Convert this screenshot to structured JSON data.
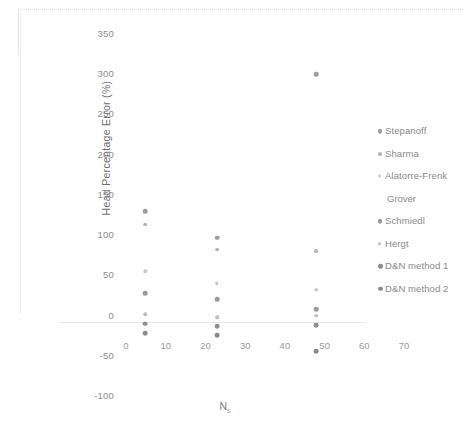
{
  "chart_data": {
    "type": "scatter",
    "title": "",
    "xlabel": "N",
    "xlabel_sub": "s",
    "ylabel": "Head Percentage Error (%)",
    "xlim": [
      0,
      74
    ],
    "ylim": [
      -100,
      365
    ],
    "xticks": [
      "0",
      "10",
      "20",
      "30",
      "40",
      "50",
      "60",
      "70"
    ],
    "xtick_values": [
      0,
      10,
      20,
      30,
      40,
      50,
      60,
      70
    ],
    "yticks": [
      "350",
      "300",
      "250",
      "200",
      "150",
      "100",
      "50",
      "0",
      "-50",
      "-100"
    ],
    "ytick_values": [
      350,
      300,
      250,
      200,
      150,
      100,
      50,
      0,
      -50,
      -100
    ],
    "grid": false,
    "legend_position": "right",
    "series": [
      {
        "name": "Stepanoff",
        "color": "#9c9c9c",
        "size": 2.4,
        "points": [
          {
            "x": 20,
            "y": 130
          },
          {
            "x": 38,
            "y": 97
          },
          {
            "x": 63,
            "y": 300
          }
        ]
      },
      {
        "name": "Sharma",
        "color": "#b4b4b4",
        "size": 2.0,
        "points": [
          {
            "x": 20,
            "y": 113
          },
          {
            "x": 38,
            "y": 82
          },
          {
            "x": 63,
            "y": 80
          }
        ]
      },
      {
        "name": "Alatorre-Frenk",
        "name_cont": "Grover",
        "color": "#c9c9c9",
        "size": 1.8,
        "points": [
          {
            "x": 20,
            "y": 55
          },
          {
            "x": 38,
            "y": 40
          },
          {
            "x": 63,
            "y": 32
          }
        ]
      },
      {
        "name": "Schmiedl",
        "color": "#9a9a9a",
        "size": 2.4,
        "points": [
          {
            "x": 20,
            "y": 28
          },
          {
            "x": 38,
            "y": 20
          },
          {
            "x": 63,
            "y": 8
          }
        ]
      },
      {
        "name": "Hergt",
        "color": "#bdbdbd",
        "size": 1.9,
        "points": [
          {
            "x": 20,
            "y": 2
          },
          {
            "x": 38,
            "y": -2
          },
          {
            "x": 63,
            "y": 0
          }
        ]
      },
      {
        "name": "D&N method 1",
        "color": "#8f8f8f",
        "size": 2.5,
        "points": [
          {
            "x": 20,
            "y": -10
          },
          {
            "x": 38,
            "y": -13
          },
          {
            "x": 63,
            "y": -12
          }
        ]
      },
      {
        "name": "D&N method 2",
        "color": "#8a8a8a",
        "size": 2.5,
        "points": [
          {
            "x": 20,
            "y": -22
          },
          {
            "x": 38,
            "y": -24
          },
          {
            "x": 63,
            "y": -44
          }
        ]
      }
    ]
  },
  "legend": {
    "items": [
      {
        "label": "Stepanoff",
        "color": "#9c9c9c",
        "size": 2.4
      },
      {
        "label": "Sharma",
        "color": "#b4b4b4",
        "size": 2.1
      },
      {
        "label": "Alatorre-Frenk",
        "color": "#c9c9c9",
        "size": 1.7,
        "cont": "Grover"
      },
      {
        "label": "Schmiedl",
        "color": "#9a9a9a",
        "size": 2.4
      },
      {
        "label": "Hergt",
        "color": "#bdbdbd",
        "size": 1.9
      },
      {
        "label": "D&N method 1",
        "color": "#8f8f8f",
        "size": 2.5
      },
      {
        "label": "D&N method 2",
        "color": "#8a8a8a",
        "size": 2.5
      }
    ]
  }
}
